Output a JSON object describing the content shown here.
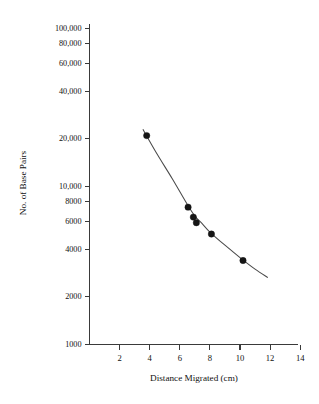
{
  "chart_data": {
    "type": "scatter",
    "title": "",
    "xlabel": "Distance Migrated (cm)",
    "ylabel": "No. of Base Pairs",
    "xscale": "linear",
    "yscale": "log",
    "xlim": [
      0,
      14.55
    ],
    "ylim": [
      1000,
      100000
    ],
    "grid": false,
    "legend": null,
    "xticks": [
      2,
      4,
      6,
      8,
      10,
      12,
      14
    ],
    "xtick_labels": [
      "2",
      "4",
      "6",
      "8",
      "10",
      "12",
      "14"
    ],
    "yticks": [
      100000,
      80000,
      60000,
      40000,
      20000,
      10000,
      8000,
      6000,
      4000,
      2000,
      1000
    ],
    "ytick_labels": [
      "100,000",
      "80,000",
      "60,000",
      "40,000",
      "20,000",
      "10,000",
      "8000",
      "6000",
      "4000",
      "2000",
      "1000"
    ],
    "series": [
      {
        "name": "DNA fragments",
        "marker": "filled-circle",
        "marker_color": "#151515",
        "x": [
          3.8,
          6.55,
          6.9,
          7.1,
          8.1,
          10.2
        ],
        "y": [
          21000,
          7400,
          6400,
          5900,
          5000,
          3400
        ]
      },
      {
        "name": "standard curve",
        "type": "line",
        "line_color": "#4a4a4a",
        "x": [
          3.55,
          4.5,
          5.5,
          6.5,
          7.0,
          7.5,
          8.0,
          9.0,
          10.0,
          11.0,
          11.85
        ],
        "y": [
          23000,
          16000,
          11200,
          7700,
          6500,
          5800,
          5150,
          4250,
          3550,
          3000,
          2650
        ]
      }
    ]
  },
  "axes": {
    "y_axis_label": "No. of Base Pairs",
    "x_axis_label": "Distance Migrated (cm)"
  }
}
